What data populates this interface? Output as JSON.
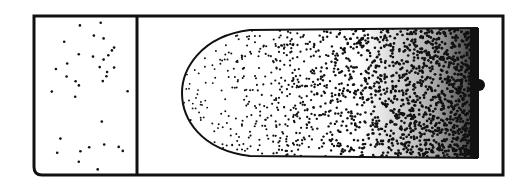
{
  "diagram": {
    "colors": {
      "ink": "#111111",
      "background": "#ffffff"
    },
    "outer_frame": {
      "x": 34,
      "y": 16,
      "width": 469,
      "height": 159
    },
    "divider_x": 137,
    "left_compartment": {
      "particle_count": 34,
      "density": "sparse"
    },
    "right_blob": {
      "x_start": 182,
      "x_end": 478,
      "y_top": 28,
      "y_bottom": 158,
      "gradient": "density increases left to right",
      "protrusion": {
        "x": 480,
        "y": 85,
        "radius": 6
      }
    }
  }
}
